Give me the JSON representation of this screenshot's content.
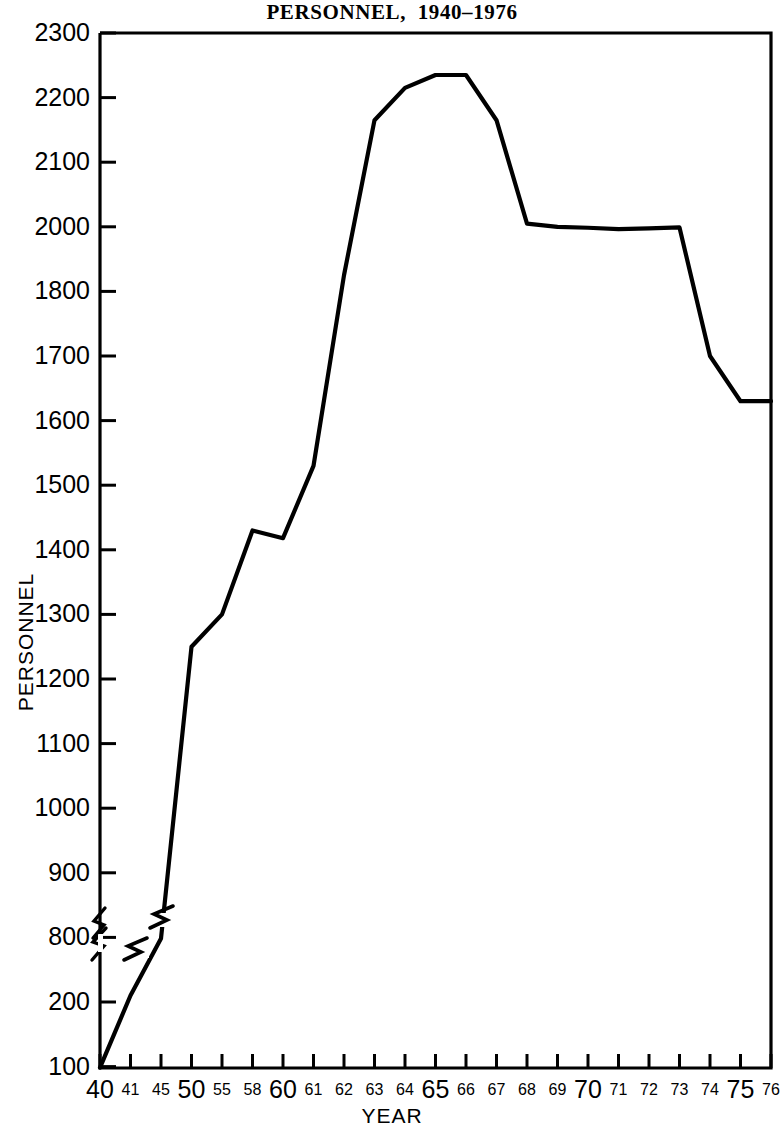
{
  "chart_data": {
    "type": "line",
    "title": "PERSONNEL,  1940–1976",
    "xlabel": "YEAR",
    "ylabel": "PERSONNEL",
    "grid": false,
    "legend": null,
    "axis_note": "y-axis is broken between 200 and 800; tick spacing is uniform per label (non-linear), 1900 label omitted",
    "x_axis": {
      "type": "category",
      "tick_labels": [
        "40",
        "41",
        "45",
        "50",
        "55",
        "58",
        "60",
        "61",
        "62",
        "63",
        "64",
        "65",
        "66",
        "67",
        "68",
        "69",
        "70",
        "71",
        "72",
        "73",
        "74",
        "75",
        "76"
      ],
      "major_labels": [
        "40",
        "50",
        "60",
        "65",
        "70",
        "75"
      ]
    },
    "y_axis": {
      "type": "broken",
      "tick_labels": [
        "100",
        "200",
        "800",
        "900",
        "1000",
        "1100",
        "1200",
        "1300",
        "1400",
        "1500",
        "1600",
        "1700",
        "1800",
        "2000",
        "2100",
        "2200",
        "2300"
      ],
      "break_between": [
        "200",
        "800"
      ],
      "ylim": [
        0,
        2300
      ]
    },
    "categories": [
      "40",
      "41",
      "45",
      "50",
      "55",
      "58",
      "60",
      "61",
      "62",
      "63",
      "64",
      "65",
      "66",
      "67",
      "68",
      "69",
      "70",
      "71",
      "72",
      "73",
      "74",
      "75",
      "76"
    ],
    "values": [
      30,
      260,
      790,
      1250,
      1300,
      1430,
      1418,
      1530,
      1850,
      2165,
      2215,
      2235,
      2235,
      2165,
      2005,
      2000,
      1997,
      1993,
      1995,
      1998,
      1700,
      1630,
      1630
    ],
    "series": [
      {
        "name": "PERSONNEL",
        "color": "#000000",
        "points": [
          {
            "x": "40",
            "y": 30
          },
          {
            "x": "41",
            "y": 260
          },
          {
            "x": "45",
            "y": 790
          },
          {
            "x": "50",
            "y": 1250
          },
          {
            "x": "55",
            "y": 1300
          },
          {
            "x": "58",
            "y": 1430
          },
          {
            "x": "60",
            "y": 1418
          },
          {
            "x": "61",
            "y": 1530
          },
          {
            "x": "62",
            "y": 1850
          },
          {
            "x": "63",
            "y": 2165
          },
          {
            "x": "64",
            "y": 2215
          },
          {
            "x": "65",
            "y": 2235
          },
          {
            "x": "66",
            "y": 2235
          },
          {
            "x": "67",
            "y": 2165
          },
          {
            "x": "68",
            "y": 2005
          },
          {
            "x": "69",
            "y": 2000
          },
          {
            "x": "70",
            "y": 1997
          },
          {
            "x": "71",
            "y": 1993
          },
          {
            "x": "72",
            "y": 1995
          },
          {
            "x": "73",
            "y": 1998
          },
          {
            "x": "74",
            "y": 1700
          },
          {
            "x": "75",
            "y": 1630
          },
          {
            "x": "76",
            "y": 1630
          }
        ]
      }
    ]
  }
}
